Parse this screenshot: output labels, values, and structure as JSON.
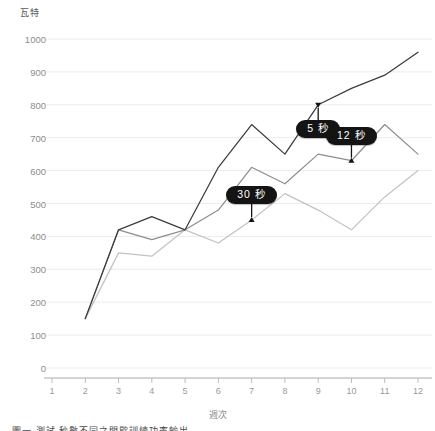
{
  "chart_data": {
    "type": "line",
    "title": "",
    "xlabel": "週次",
    "ylabel": "瓦特",
    "ylim": [
      0,
      1000
    ],
    "xlim": [
      1,
      12
    ],
    "grid": true,
    "legend_position": "inline-annotations",
    "y_ticks": [
      0,
      100,
      200,
      300,
      400,
      500,
      600,
      700,
      800,
      900,
      1000
    ],
    "x_ticks": [
      1,
      2,
      3,
      4,
      5,
      6,
      7,
      8,
      9,
      10,
      11,
      12
    ],
    "categories": [
      2,
      3,
      4,
      5,
      6,
      7,
      8,
      9,
      10,
      11,
      12
    ],
    "series": [
      {
        "name": "5 秒",
        "color": "#3c3c3c",
        "values": [
          150,
          420,
          460,
          420,
          610,
          740,
          650,
          800,
          850,
          890,
          960
        ]
      },
      {
        "name": "12 秒",
        "color": "#8e8e8e",
        "values": [
          150,
          420,
          390,
          420,
          480,
          610,
          560,
          650,
          630,
          740,
          650
        ]
      },
      {
        "name": "30 秒",
        "color": "#c3c3c3",
        "values": [
          150,
          350,
          340,
          420,
          380,
          450,
          530,
          480,
          420,
          520,
          600
        ]
      }
    ],
    "annotations": [
      {
        "label": "5 秒",
        "series": "5 秒",
        "week": 9,
        "value": 800,
        "pointer": "down"
      },
      {
        "label": "12 秒",
        "series": "12 秒",
        "week": 10,
        "value": 630,
        "pointer": "up"
      },
      {
        "label": "30 秒",
        "series": "30 秒",
        "week": 7,
        "value": 450,
        "pointer": "up"
      }
    ]
  },
  "axes": {
    "y_title": "瓦特",
    "x_title": "週次",
    "y_tick_labels": [
      "1000",
      "900",
      "800",
      "700",
      "600",
      "500",
      "400",
      "300",
      "200",
      "100",
      "0"
    ],
    "x_tick_labels": [
      "1",
      "2",
      "3",
      "4",
      "5",
      "6",
      "7",
      "8",
      "9",
      "10",
      "11",
      "12"
    ]
  },
  "annotations": {
    "a0": "5 秒",
    "a1": "12 秒",
    "a2": "30 秒"
  },
  "caption": {
    "text": "圖一 測試 秒數不同之間歇訓練功率輸出"
  }
}
